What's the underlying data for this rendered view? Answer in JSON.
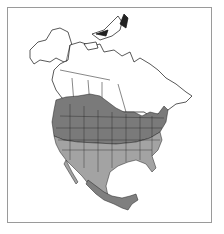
{
  "map": {
    "subject": "North America range map",
    "regions": [
      {
        "id": "canada",
        "label": "Canada",
        "range": "none"
      },
      {
        "id": "alaska",
        "label": "Alaska",
        "range": "none"
      },
      {
        "id": "northern-us",
        "label": "Northern United States / southern Canadian prairies",
        "range": "breeding"
      },
      {
        "id": "southern-us",
        "label": "Southern United States and northern Mexico",
        "range": "year-round"
      },
      {
        "id": "southern-mexico",
        "label": "Southern Mexico and Pacific coast",
        "range": "winter"
      }
    ],
    "colors": {
      "background": "#ffffff",
      "land_outside_range": "#ffffff",
      "breeding": "#7a7a7a",
      "year_round": "#a3a3a3",
      "winter": "#7f7f7f",
      "borders": "#111111",
      "frame": "#9a9a9a"
    }
  }
}
